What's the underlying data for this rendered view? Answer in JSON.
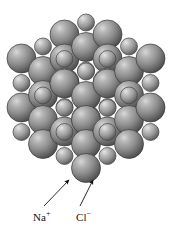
{
  "figure": {
    "name": "sodium-chloride-crystal-lattice",
    "background_color": "#ffffff",
    "width": 175,
    "height": 236
  },
  "legend": {
    "cation": {
      "symbol": "Na",
      "charge": "+",
      "full": "Na+",
      "x": 33,
      "y": 212
    },
    "anion": {
      "symbol": "Cl",
      "charge": "−",
      "full": "Cl−",
      "x": 76,
      "y": 212
    }
  },
  "annotations": {
    "arrows": [
      {
        "name": "arrow-to-sodium-ion",
        "points_to": "Na+",
        "tail_x": 44,
        "tail_y": 206,
        "tip_x": 69,
        "tip_y": 180
      },
      {
        "name": "arrow-to-chloride-ion",
        "points_to": "Cl-",
        "tail_x": 80,
        "tail_y": 206,
        "tip_x": 93,
        "tip_y": 180
      }
    ]
  },
  "model": {
    "type": "space-filling",
    "lattice": "face-centered-cubic-rock-salt",
    "grid": 4,
    "spacing": 25.5,
    "origin_x": 86,
    "origin_y": 96,
    "axis_a": [
      -21.5,
      12.0
    ],
    "axis_b": [
      21.5,
      12.0
    ],
    "axis_c": [
      0.0,
      -24.5
    ],
    "ions": {
      "anion": {
        "label": "Cl-",
        "radius": 14.5,
        "base_color": "#8c8c8c",
        "highlight_color": "#d8d8d8",
        "shadow_color": "#4a4a4a",
        "edge_color": "#3a3a3a"
      },
      "cation": {
        "label": "Na+",
        "radius": 8.5,
        "base_color": "#9a9a9a",
        "highlight_color": "#e2e2e2",
        "shadow_color": "#565656",
        "edge_color": "#444444"
      }
    }
  }
}
